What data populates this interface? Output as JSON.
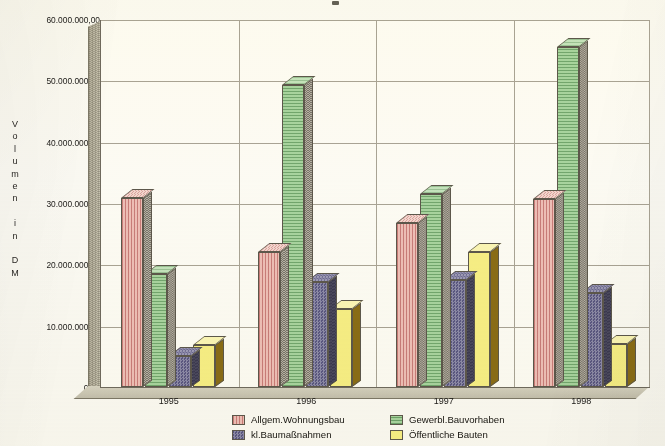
{
  "axes": {
    "y_title_chars": [
      "V",
      "o",
      "l",
      "u",
      "m",
      "e",
      "n",
      "",
      "i",
      "n",
      "",
      "D",
      "M"
    ],
    "y_title": "Volumen in DM",
    "y_ticks": [
      "0,00",
      "10.000.000,00",
      "20.000.000,00",
      "30.000.000,00",
      "40.000.000,00",
      "50.000.000,00",
      "60.000.000,00"
    ],
    "x_ticks": [
      "1995",
      "1996",
      "1997",
      "1998"
    ]
  },
  "legend": {
    "items": [
      {
        "label": "Allgem.Wohnungsbau",
        "swatch": "pink-striped-swatch",
        "color": "#eebfb8"
      },
      {
        "label": "Gewerbl.Bauvorhaben",
        "swatch": "green-striped-swatch",
        "color": "#a8d4a0"
      },
      {
        "label": "kl.Baumaßnahmen",
        "swatch": "blue-dotted-swatch",
        "color": "#5a5782"
      },
      {
        "label": "Öffentliche Bauten",
        "swatch": "yellow-solid-swatch",
        "color": "#f7ef86"
      }
    ]
  },
  "chart_data": {
    "type": "bar",
    "title": "",
    "xlabel": "",
    "ylabel": "Volumen in DM",
    "categories": [
      "1995",
      "1996",
      "1997",
      "1998"
    ],
    "ylim": [
      0,
      60000000
    ],
    "ytick_values": [
      0,
      10000000,
      20000000,
      30000000,
      40000000,
      50000000,
      60000000
    ],
    "grid": true,
    "legend_position": "bottom",
    "series": [
      {
        "name": "Allgem.Wohnungsbau",
        "color": "#eebfb8",
        "values": [
          30800000,
          22000000,
          26800000,
          30700000
        ]
      },
      {
        "name": "Gewerbl.Bauvorhaben",
        "color": "#a8d4a0",
        "values": [
          18500000,
          49200000,
          31500000,
          55500000
        ]
      },
      {
        "name": "kl.Baumaßnahmen",
        "color": "#5a5782",
        "values": [
          5000000,
          17200000,
          17500000,
          15300000
        ]
      },
      {
        "name": "Öffentliche Bauten",
        "color": "#f7ef86",
        "values": [
          6800000,
          12700000,
          22000000,
          7000000
        ]
      }
    ]
  }
}
